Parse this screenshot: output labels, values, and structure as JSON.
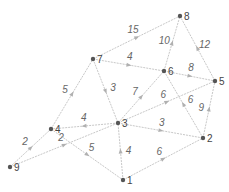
{
  "graph": {
    "type": "directed-weighted-graph",
    "nodes": [
      {
        "id": "1",
        "label": "1",
        "x": 123,
        "y": 180
      },
      {
        "id": "2",
        "label": "2",
        "x": 203,
        "y": 138
      },
      {
        "id": "3",
        "label": "3",
        "x": 118,
        "y": 123
      },
      {
        "id": "4",
        "label": "4",
        "x": 51,
        "y": 129
      },
      {
        "id": "5",
        "label": "5",
        "x": 215,
        "y": 81
      },
      {
        "id": "6",
        "label": "6",
        "x": 164,
        "y": 71
      },
      {
        "id": "7",
        "label": "7",
        "x": 93,
        "y": 59
      },
      {
        "id": "8",
        "label": "8",
        "x": 180,
        "y": 16
      },
      {
        "id": "9",
        "label": "9",
        "x": 10,
        "y": 167
      }
    ],
    "edges": [
      {
        "from": "7",
        "to": "8",
        "weight": "15"
      },
      {
        "from": "6",
        "to": "8",
        "weight": "10"
      },
      {
        "from": "5",
        "to": "8",
        "weight": "12"
      },
      {
        "from": "7",
        "to": "6",
        "weight": "4"
      },
      {
        "from": "6",
        "to": "5",
        "weight": "8"
      },
      {
        "from": "7",
        "to": "3",
        "weight": "3"
      },
      {
        "from": "3",
        "to": "6",
        "weight": "7"
      },
      {
        "from": "3",
        "to": "5",
        "weight": "6"
      },
      {
        "from": "2",
        "to": "6",
        "weight": "6"
      },
      {
        "from": "2",
        "to": "5",
        "weight": "9"
      },
      {
        "from": "3",
        "to": "2",
        "weight": "3"
      },
      {
        "from": "4",
        "to": "7",
        "weight": "5"
      },
      {
        "from": "3",
        "to": "4",
        "weight": "4"
      },
      {
        "from": "9",
        "to": "4",
        "weight": "2"
      },
      {
        "from": "9",
        "to": "3",
        "weight": "2"
      },
      {
        "from": "4",
        "to": "1",
        "weight": "5"
      },
      {
        "from": "1",
        "to": "3",
        "weight": "4"
      },
      {
        "from": "1",
        "to": "2",
        "weight": "6"
      }
    ]
  },
  "colors": {
    "edge": "#c8c8c8",
    "node": "#555555",
    "text": "#444444"
  }
}
